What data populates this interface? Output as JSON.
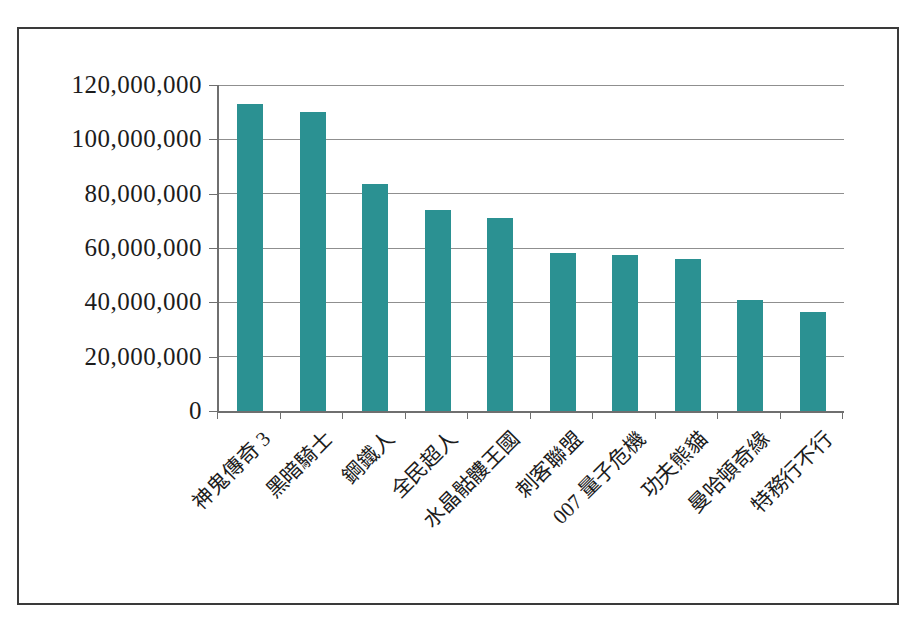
{
  "chart_data": {
    "type": "bar",
    "title": "",
    "xlabel": "",
    "ylabel": "",
    "categories": [
      "神鬼傳奇 3",
      "黑暗騎士",
      "鋼鐵人",
      "全民超人",
      "水晶骷髏王國",
      "刺客聯盟",
      "007 量子危機",
      "功夫熊貓",
      "曼哈頓奇緣",
      "特務行不行"
    ],
    "values": [
      113000000,
      110000000,
      83500000,
      74000000,
      71000000,
      58000000,
      57500000,
      56000000,
      41000000,
      36500000
    ],
    "ylim": [
      0,
      120000000
    ],
    "y_ticks": [
      0,
      20000000,
      40000000,
      60000000,
      80000000,
      100000000,
      120000000
    ],
    "y_tick_labels": [
      "0",
      "20,000,000",
      "40,000,000",
      "60,000,000",
      "80,000,000",
      "100,000,000",
      "120,000,000"
    ],
    "grid": true,
    "legend": "none",
    "colors": {
      "bar": "#2B9192",
      "gridline": "#8f8f8f",
      "axis": "#6f6f6f",
      "text": "#1c1c1c",
      "frame_border": "#3a3a3a",
      "background": "#ffffff"
    }
  }
}
